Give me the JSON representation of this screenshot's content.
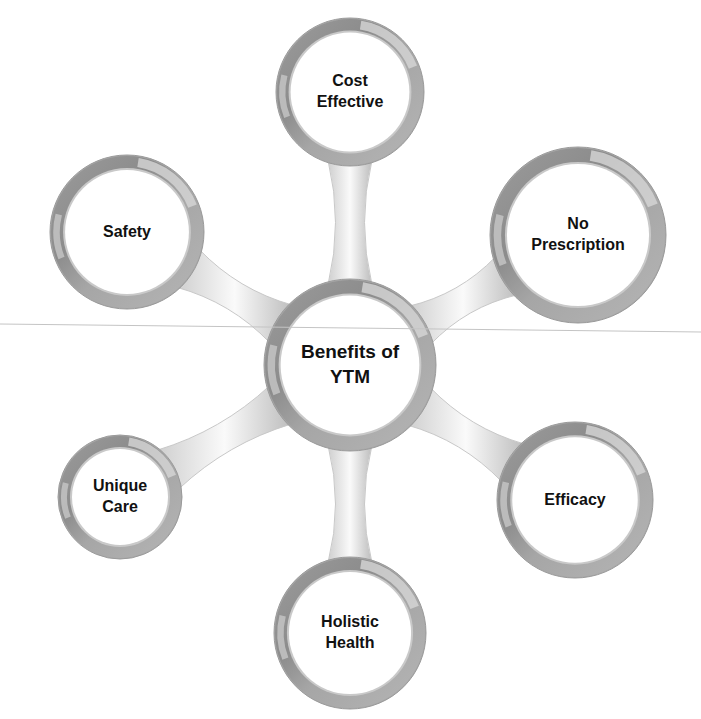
{
  "diagram": {
    "type": "hub-and-spoke",
    "center": {
      "lines": [
        "Benefits of",
        "YTM"
      ],
      "cx": 350,
      "cy": 365,
      "r": 86
    },
    "nodes": [
      {
        "id": "cost-effective",
        "lines": [
          "Cost",
          "Effective"
        ],
        "cx": 350,
        "cy": 92,
        "r": 74
      },
      {
        "id": "no-prescription",
        "lines": [
          "No",
          "Prescription"
        ],
        "cx": 578,
        "cy": 235,
        "r": 88
      },
      {
        "id": "safety",
        "lines": [
          "Safety"
        ],
        "cx": 127,
        "cy": 232,
        "r": 77
      },
      {
        "id": "unique-care",
        "lines": [
          "Unique",
          "Care"
        ],
        "cx": 120,
        "cy": 497,
        "r": 62
      },
      {
        "id": "efficacy",
        "lines": [
          "Efficacy"
        ],
        "cx": 575,
        "cy": 500,
        "r": 78
      },
      {
        "id": "holistic-health",
        "lines": [
          "Holistic",
          "Health"
        ],
        "cx": 350,
        "cy": 633,
        "r": 76
      }
    ],
    "colors": {
      "ring_dark": "#8a8a8a",
      "ring_mid": "#a8a8a8",
      "ring_light": "#d6d6d6",
      "inner_fill": "#ffffff",
      "connector": "#e6e6e6",
      "text": "#111111",
      "scan_line": "#bdbdbd"
    }
  }
}
